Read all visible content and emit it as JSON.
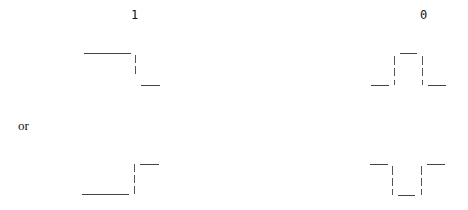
{
  "labels": {
    "one": "1",
    "zero": "0",
    "or": "or"
  },
  "waveforms": [
    {
      "name": "one-falling",
      "bit": "1",
      "description": "high then falls to low at mid-bit"
    },
    {
      "name": "zero-pulse-high",
      "bit": "0",
      "description": "low, pulse high, low"
    },
    {
      "name": "one-rising",
      "bit": "1",
      "description": "low then rises to high at mid-bit"
    },
    {
      "name": "zero-pulse-low",
      "bit": "0",
      "description": "high, pulse low, high"
    }
  ],
  "colors": {
    "line": "#444444",
    "text": "#111111",
    "background": "#ffffff"
  }
}
